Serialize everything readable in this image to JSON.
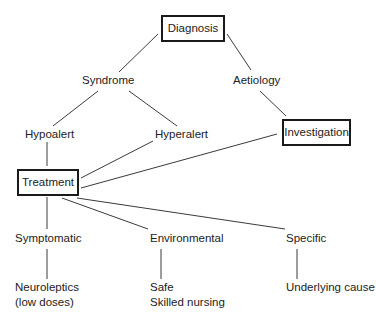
{
  "diagram": {
    "type": "tree",
    "nodes": {
      "diagnosis": {
        "label": "Diagnosis",
        "boxed": true
      },
      "syndrome": {
        "label": "Syndrome",
        "boxed": false
      },
      "aetiology": {
        "label": "Aetiology",
        "boxed": false
      },
      "hypoalert": {
        "label": "Hypoalert",
        "boxed": false
      },
      "hyperalert": {
        "label": "Hyperalert",
        "boxed": false
      },
      "investigation": {
        "label": "Investigation",
        "boxed": true
      },
      "treatment": {
        "label": "Treatment",
        "boxed": true
      },
      "symptomatic": {
        "label": "Symptomatic",
        "boxed": false
      },
      "environmental": {
        "label": "Environmental",
        "boxed": false
      },
      "specific": {
        "label": "Specific",
        "boxed": false
      },
      "neuroleptics": {
        "label_line1": "Neuroleptics",
        "label_line2": "(low doses)",
        "boxed": false
      },
      "safe_nursing": {
        "label_line1": "Safe",
        "label_line2": "Skilled nursing",
        "boxed": false
      },
      "underlying_cause": {
        "label": "Underlying cause",
        "boxed": false
      }
    },
    "edges": [
      {
        "from": "diagnosis",
        "to": "syndrome"
      },
      {
        "from": "diagnosis",
        "to": "aetiology"
      },
      {
        "from": "syndrome",
        "to": "hypoalert"
      },
      {
        "from": "syndrome",
        "to": "hyperalert"
      },
      {
        "from": "aetiology",
        "to": "investigation"
      },
      {
        "from": "hypoalert",
        "to": "treatment"
      },
      {
        "from": "hyperalert",
        "to": "treatment"
      },
      {
        "from": "investigation",
        "to": "treatment"
      },
      {
        "from": "treatment",
        "to": "symptomatic"
      },
      {
        "from": "treatment",
        "to": "environmental"
      },
      {
        "from": "treatment",
        "to": "specific"
      },
      {
        "from": "symptomatic",
        "to": "neuroleptics"
      },
      {
        "from": "environmental",
        "to": "safe_nursing"
      },
      {
        "from": "specific",
        "to": "underlying_cause"
      }
    ]
  }
}
